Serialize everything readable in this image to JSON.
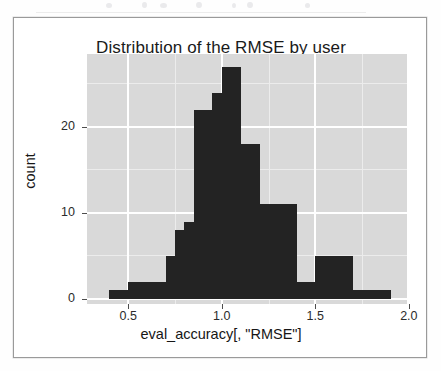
{
  "figure": {
    "title": "Distribution of the RMSE by user",
    "background_color": "#ffffff",
    "frame_color": "#9a9a9a",
    "panel_color": "#d9d9d9",
    "gridline_color": "#ffffff",
    "bar_color": "#232323"
  },
  "chart_data": {
    "type": "bar",
    "chart_subtype": "histogram",
    "title": "Distribution of the RMSE by user",
    "xlabel": "eval_accuracy[, \"RMSE\"]",
    "ylabel": "count",
    "xlim": [
      0.28,
      1.99
    ],
    "ylim": [
      0,
      28.5
    ],
    "xticks": [
      0.5,
      1.0,
      1.5,
      2.0
    ],
    "xtick_labels": [
      "0.5",
      "1.0",
      "1.5",
      "2.0"
    ],
    "yticks": [
      0,
      10,
      20
    ],
    "ytick_labels": [
      "0",
      "10",
      "20"
    ],
    "grid": true,
    "grid_major_color": "#ffffff",
    "grid_minor_color": "#ececec",
    "legend": null,
    "bin_width": 0.1,
    "bin_starts": [
      0.4,
      0.5,
      0.6,
      0.7,
      0.8,
      0.9,
      1.0,
      1.1,
      1.2,
      1.3,
      1.4,
      1.5,
      1.6,
      1.7,
      1.8
    ],
    "bins": [
      {
        "x0": 0.4,
        "x1": 0.45,
        "count": 1
      },
      {
        "x0": 0.45,
        "x1": 0.5,
        "count": 1
      },
      {
        "x0": 0.5,
        "x1": 0.55,
        "count": 2
      },
      {
        "x0": 0.55,
        "x1": 0.6,
        "count": 2
      },
      {
        "x0": 0.6,
        "x1": 0.65,
        "count": 2
      },
      {
        "x0": 0.65,
        "x1": 0.7,
        "count": 2
      },
      {
        "x0": 0.7,
        "x1": 0.75,
        "count": 5
      },
      {
        "x0": 0.75,
        "x1": 0.8,
        "count": 8
      },
      {
        "x0": 0.8,
        "x1": 0.85,
        "count": 9
      },
      {
        "x0": 0.85,
        "x1": 0.9,
        "count": 22
      },
      {
        "x0": 0.9,
        "x1": 0.95,
        "count": 22
      },
      {
        "x0": 0.95,
        "x1": 1.0,
        "count": 24
      },
      {
        "x0": 1.0,
        "x1": 1.05,
        "count": 27
      },
      {
        "x0": 1.05,
        "x1": 1.1,
        "count": 27
      },
      {
        "x0": 1.1,
        "x1": 1.15,
        "count": 18
      },
      {
        "x0": 1.15,
        "x1": 1.2,
        "count": 18
      },
      {
        "x0": 1.2,
        "x1": 1.25,
        "count": 11
      },
      {
        "x0": 1.25,
        "x1": 1.3,
        "count": 11
      },
      {
        "x0": 1.3,
        "x1": 1.35,
        "count": 11
      },
      {
        "x0": 1.35,
        "x1": 1.4,
        "count": 11
      },
      {
        "x0": 1.4,
        "x1": 1.45,
        "count": 2
      },
      {
        "x0": 1.45,
        "x1": 1.5,
        "count": 2
      },
      {
        "x0": 1.5,
        "x1": 1.55,
        "count": 5
      },
      {
        "x0": 1.55,
        "x1": 1.6,
        "count": 5
      },
      {
        "x0": 1.6,
        "x1": 1.65,
        "count": 5
      },
      {
        "x0": 1.65,
        "x1": 1.7,
        "count": 5
      },
      {
        "x0": 1.7,
        "x1": 1.75,
        "count": 1
      },
      {
        "x0": 1.75,
        "x1": 1.8,
        "count": 1
      },
      {
        "x0": 1.8,
        "x1": 1.85,
        "count": 1
      },
      {
        "x0": 1.85,
        "x1": 1.9,
        "count": 1
      }
    ],
    "max_count": 27,
    "mode_bin": [
      1.0,
      1.1
    ]
  }
}
